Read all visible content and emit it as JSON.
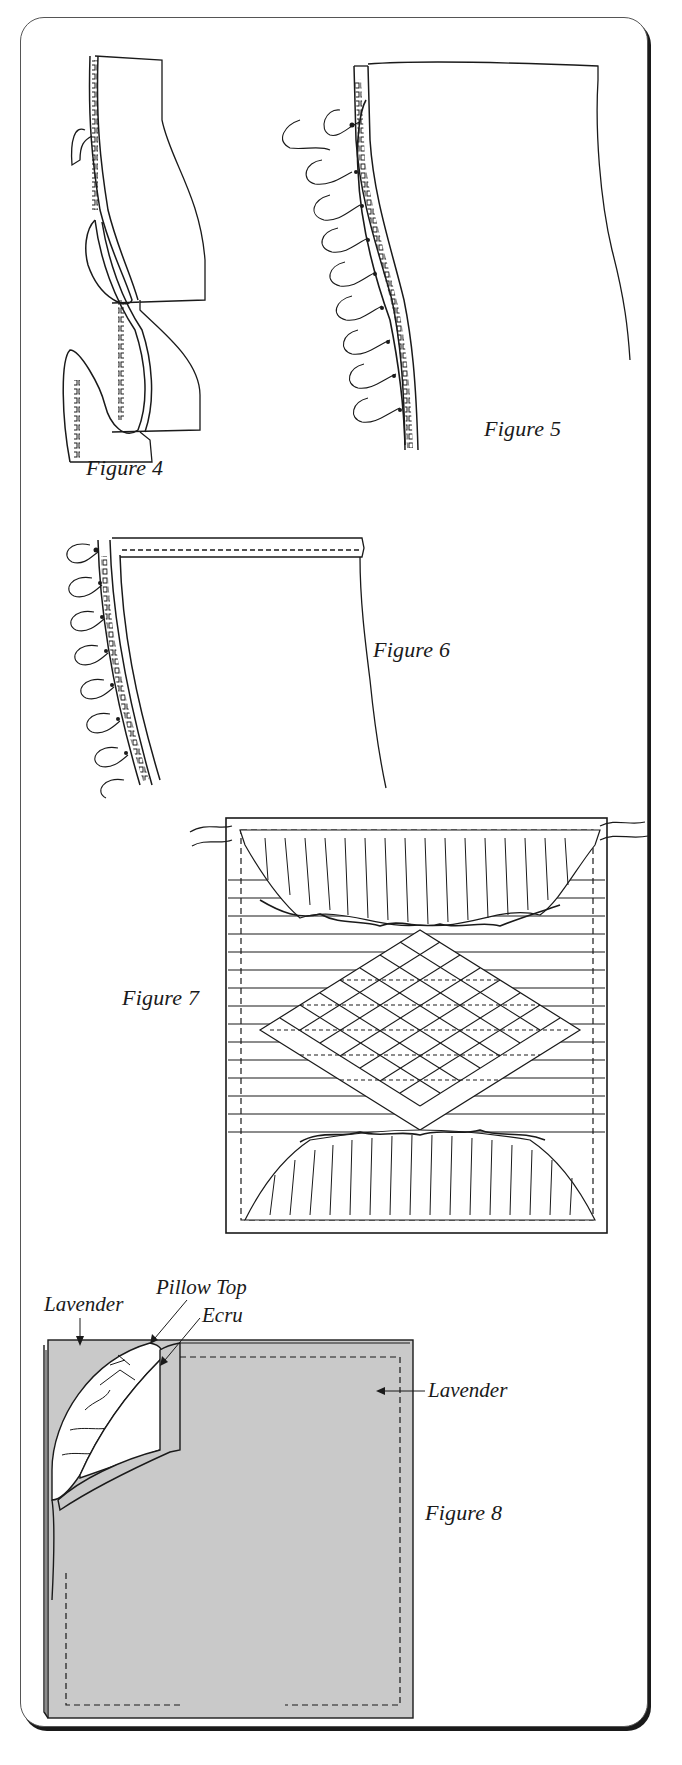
{
  "figures": [
    {
      "id": "figure-4",
      "caption": "Figure 4"
    },
    {
      "id": "figure-5",
      "caption": "Figure 5"
    },
    {
      "id": "figure-6",
      "caption": "Figure 6"
    },
    {
      "id": "figure-7",
      "caption": "Figure 7"
    },
    {
      "id": "figure-8",
      "caption": "Figure 8",
      "labels": {
        "lavender_top": "Lavender",
        "pillow_top": "Pillow Top",
        "ecru": "Ecru",
        "lavender_right": "Lavender"
      }
    }
  ],
  "colors": {
    "ink": "#1a1a1a",
    "lavender_fill": "#c9c9c9",
    "panel_border": "#555555",
    "panel_shadow": "#1a1a1a",
    "background": "#ffffff"
  }
}
